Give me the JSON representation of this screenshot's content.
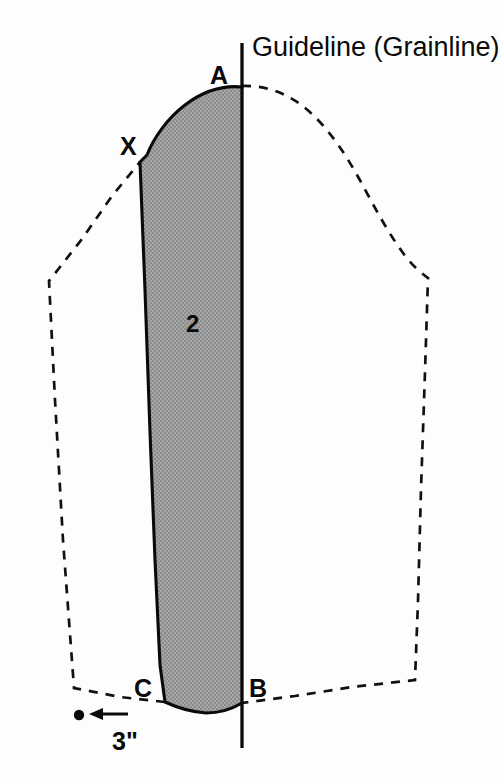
{
  "diagram": {
    "title_label": "Guideline (Grainline)",
    "piece_number": "2",
    "dimension_label": "3\"",
    "points": [
      {
        "id": "A",
        "label": "A",
        "x": 224,
        "y": 76
      },
      {
        "id": "X",
        "label": "X",
        "x": 122,
        "y": 148
      },
      {
        "id": "C",
        "label": "C",
        "x": 136,
        "y": 697
      },
      {
        "id": "B",
        "label": "B",
        "x": 238,
        "y": 697
      }
    ],
    "colors": {
      "background": "#fdfdfd",
      "piece_fill": "#9b9b9b",
      "stroke": "#0a0a0a",
      "dashed_stroke": "#111111",
      "text": "#0a0a0a"
    },
    "icons": {
      "arrow": "left-arrow-icon",
      "dot": "dot-marker-icon"
    },
    "geometry": {
      "guideline": {
        "x": 242,
        "y_top": 43,
        "y_bottom": 748
      },
      "piece_outline": "M 242 87 C 208 86 174 108 152 139 L 140 162 L 151 432 L 158 660 L 165 702 C 190 714 218 714 242 703 L 242 87 Z",
      "dashed_outline": "M 242 86 C 290 86 330 120 355 168 C 378 212 400 250 428 278 L 415 680 L 242 703 L 165 702 L 74 688 L 49 281 L 140 162",
      "dot": {
        "x": 79,
        "y": 715,
        "r": 5
      },
      "arrow": {
        "x1": 128,
        "y1": 714,
        "x2": 91,
        "y2": 714
      },
      "dimension_text": {
        "x": 113,
        "y": 749
      },
      "number_text": {
        "x": 186,
        "y": 332
      },
      "title_text": {
        "x": 252,
        "y": 56
      }
    }
  }
}
